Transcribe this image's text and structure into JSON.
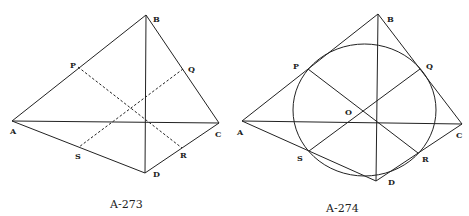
{
  "figures": [
    {
      "caption": "A-273",
      "labels": {
        "A": "A",
        "B": "B",
        "C": "C",
        "D": "D",
        "P": "P",
        "Q": "Q",
        "R": "R",
        "S": "S"
      }
    },
    {
      "caption": "A-274",
      "labels": {
        "A": "A",
        "B": "B",
        "C": "C",
        "D": "D",
        "P": "P",
        "Q": "Q",
        "R": "R",
        "S": "S",
        "O": "O"
      }
    }
  ]
}
